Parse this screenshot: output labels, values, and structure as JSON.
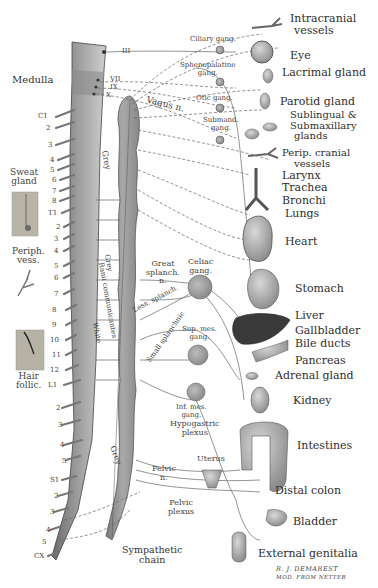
{
  "diagram": {
    "cranial_nerves": [
      "III",
      "VII",
      "IX",
      "X"
    ],
    "left_labels": {
      "medulla": "Medulla",
      "sweat_gland": [
        "Sweat",
        "gland"
      ],
      "periph_vess": [
        "Periph.",
        "vess."
      ],
      "hair_follic": [
        "Hair",
        "follic."
      ]
    },
    "spinal_levels": {
      "cervical": [
        "C1",
        "2",
        "3",
        "4",
        "5",
        "6",
        "7",
        "8"
      ],
      "thoracic": [
        "T1",
        "2",
        "3",
        "4",
        "5",
        "6",
        "7",
        "8",
        "9",
        "10",
        "11",
        "12"
      ],
      "lumbar": [
        "L1",
        "2",
        "3",
        "4",
        "5"
      ],
      "sacral": [
        "S1",
        "2",
        "3",
        "4",
        "5"
      ],
      "coccygeal": [
        "CX"
      ]
    },
    "nerve_labels": {
      "vagus": "Vagus n.",
      "grey_upper": "Grey",
      "grey_lower": "Grey",
      "rami": "Rami communicantes",
      "grey_rami": "Grey",
      "white_rami": "White",
      "great_splanch": [
        "Great",
        "splanch.",
        "n."
      ],
      "less_splanch": "Less. splanch.",
      "small_splanchnic": "Small splanchnic",
      "pelvic_n": [
        "Pelvic",
        "n."
      ],
      "sympathetic_chain": [
        "Sympathetic",
        "chain"
      ]
    },
    "ganglia": {
      "ciliary": "Ciliary gang.",
      "sphenopalatine": [
        "Sphenopalatine",
        "gang."
      ],
      "otic": "Otic gang.",
      "submand": [
        "Submand.",
        "gang."
      ],
      "celiac": [
        "Celiac",
        "gang."
      ],
      "sup_mes": [
        "Sup. mes.",
        "gang."
      ],
      "inf_mes": [
        "Inf. mes.",
        "gang."
      ],
      "hypogastric": [
        "Hypogastric",
        "plexus"
      ],
      "uterus": "Uterus",
      "pelvic_plexus": [
        "Pelvic",
        "plexus"
      ]
    },
    "organs": [
      {
        "id": "intracranial",
        "lines": [
          "Intracranial",
          "vessels"
        ]
      },
      {
        "id": "eye",
        "lines": [
          "Eye"
        ]
      },
      {
        "id": "lacrimal",
        "lines": [
          "Lacrimal gland"
        ]
      },
      {
        "id": "parotid",
        "lines": [
          "Parotid gland"
        ]
      },
      {
        "id": "sublingual",
        "lines": [
          "Sublingual &",
          "Submaxillary",
          "glands"
        ]
      },
      {
        "id": "perip_cranial",
        "lines": [
          "Perip. cranial",
          "vessels"
        ]
      },
      {
        "id": "larynx",
        "lines": [
          "Larynx"
        ]
      },
      {
        "id": "trachea",
        "lines": [
          "Trachea"
        ]
      },
      {
        "id": "bronchi",
        "lines": [
          "Bronchi"
        ]
      },
      {
        "id": "lungs",
        "lines": [
          "Lungs"
        ]
      },
      {
        "id": "heart",
        "lines": [
          "Heart"
        ]
      },
      {
        "id": "stomach",
        "lines": [
          "Stomach"
        ]
      },
      {
        "id": "liver",
        "lines": [
          "Liver"
        ]
      },
      {
        "id": "gallbladder",
        "lines": [
          "Gallbladder"
        ]
      },
      {
        "id": "bile_ducts",
        "lines": [
          "Bile ducts"
        ]
      },
      {
        "id": "pancreas",
        "lines": [
          "Pancreas"
        ]
      },
      {
        "id": "adrenal",
        "lines": [
          "Adrenal gland"
        ]
      },
      {
        "id": "kidney",
        "lines": [
          "Kidney"
        ]
      },
      {
        "id": "intestines",
        "lines": [
          "Intestines"
        ]
      },
      {
        "id": "distal_colon",
        "lines": [
          "Distal colon"
        ]
      },
      {
        "id": "bladder",
        "lines": [
          "Bladder"
        ]
      },
      {
        "id": "genitalia",
        "lines": [
          "External genitalia"
        ]
      }
    ],
    "signature": [
      "R. J. DEMAREST",
      "MOD. FROM NETTER"
    ]
  }
}
